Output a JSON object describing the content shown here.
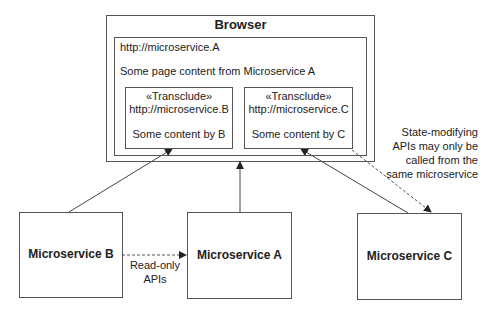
{
  "browser": {
    "title": "Browser",
    "url": "http://microservice.A",
    "content": "Some page content from Microservice A",
    "transclusions": [
      {
        "stereotype": "«Transclude»",
        "url": "http://microservice.B",
        "content": "Some content by B"
      },
      {
        "stereotype": "«Transclude»",
        "url": "http://microservice.C",
        "content": "Some content by C"
      }
    ]
  },
  "services": [
    {
      "name": "Microservice B"
    },
    {
      "name": "Microservice A"
    },
    {
      "name": "Microservice C"
    }
  ],
  "annotations": {
    "read_only": [
      "Read-only",
      "APIs"
    ],
    "state_modifying": [
      "State-modifying",
      "APIs may only be",
      "called from the",
      "same microservice"
    ]
  },
  "colors": {
    "stroke": "#555555",
    "text": "#222222"
  }
}
